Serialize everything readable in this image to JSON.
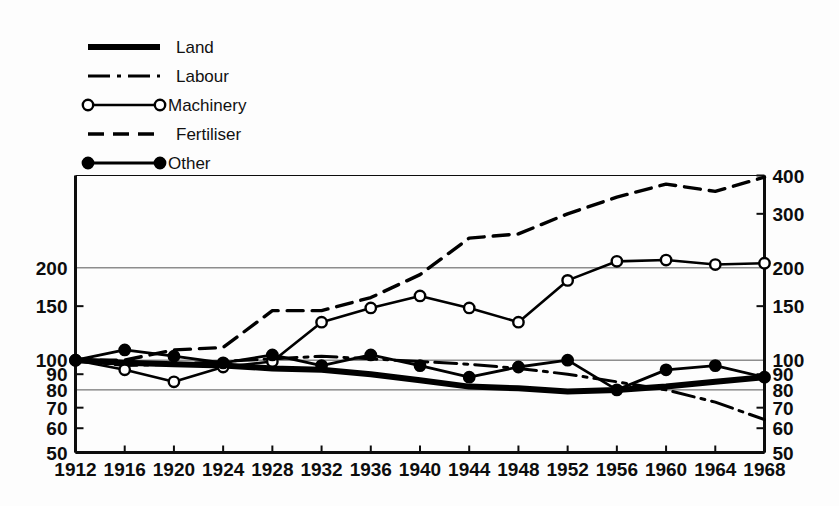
{
  "chart_data": {
    "type": "line",
    "title": "",
    "subtitle": "",
    "xlabel": "",
    "ylabel": "",
    "scale": "log",
    "index_base": "1912 = 100",
    "grid": true,
    "legend_position": "top-left",
    "x": [
      1912,
      1916,
      1920,
      1924,
      1928,
      1932,
      1936,
      1940,
      1944,
      1948,
      1952,
      1956,
      1960,
      1964,
      1968
    ],
    "xtick_labels": [
      "1912",
      "1916",
      "1920",
      "1924",
      "1928",
      "1932",
      "1936",
      "1940",
      "1944",
      "1948",
      "1952",
      "1956",
      "1960",
      "1964",
      "1968"
    ],
    "xlim": [
      1912,
      1968
    ],
    "ylim": [
      50,
      400
    ],
    "ytick_values_left": [
      50,
      60,
      70,
      80,
      90,
      100,
      150,
      200
    ],
    "ytick_labels_left": [
      "50",
      "60",
      "70",
      "80",
      "90",
      "100",
      "150",
      "200"
    ],
    "ytick_values_right": [
      50,
      60,
      70,
      80,
      90,
      100,
      150,
      200,
      300,
      400
    ],
    "ytick_labels_right": [
      "50",
      "60",
      "70",
      "80",
      "90",
      "100",
      "150",
      "200",
      "300",
      "400"
    ],
    "gridline_values": [
      80,
      100,
      200
    ],
    "series": [
      {
        "name": "Land",
        "style": "thick-solid",
        "marker": "none",
        "color": "#000000",
        "stroke_width": 6,
        "values": [
          100,
          98,
          97,
          96,
          94,
          93,
          90,
          86,
          82,
          81,
          79,
          80,
          82,
          85,
          88
        ]
      },
      {
        "name": "Labour",
        "style": "dash-dot",
        "marker": "none",
        "color": "#000000",
        "stroke_width": 3,
        "values": [
          100,
          96,
          97,
          99,
          101,
          103,
          101,
          99,
          97,
          94,
          90,
          85,
          80,
          73,
          64
        ]
      },
      {
        "name": "Machinery",
        "style": "solid",
        "marker": "open-circle",
        "color": "#000000",
        "stroke_width": 2.6,
        "values": [
          100,
          93,
          85,
          95,
          99,
          133,
          148,
          162,
          148,
          133,
          182,
          210,
          212,
          205,
          207
        ]
      },
      {
        "name": "Fertiliser",
        "style": "dashed",
        "marker": "none",
        "color": "#000000",
        "stroke_width": 3.4,
        "values": [
          100,
          100,
          108,
          110,
          145,
          145,
          160,
          190,
          250,
          258,
          300,
          340,
          375,
          355,
          395
        ]
      },
      {
        "name": "Other",
        "style": "solid",
        "marker": "filled-circle",
        "color": "#000000",
        "stroke_width": 2.8,
        "values": [
          100,
          108,
          103,
          98,
          104,
          96,
          104,
          96,
          88,
          95,
          100,
          80,
          93,
          96,
          88
        ]
      }
    ]
  },
  "legend": {
    "items": [
      {
        "label": "Land",
        "style": "thick-solid",
        "marker": "none"
      },
      {
        "label": "Labour",
        "style": "dash-dot",
        "marker": "none"
      },
      {
        "label": "Machinery",
        "style": "solid",
        "marker": "open-circle"
      },
      {
        "label": "Fertiliser",
        "style": "dashed",
        "marker": "none"
      },
      {
        "label": "Other",
        "style": "solid",
        "marker": "filled-circle"
      }
    ]
  },
  "colors": {
    "ink": "#0d0d0d",
    "grid": "#555555",
    "background": "#fdfdfd",
    "marker_fill_open": "#ffffff",
    "marker_fill_closed": "#000000"
  }
}
